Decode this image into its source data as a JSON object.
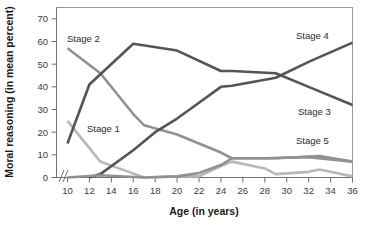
{
  "chart_data": {
    "type": "line",
    "title": "",
    "xlabel": "Age (in years)",
    "ylabel": "Moral reasoning (in mean percent)",
    "xlim": [
      9,
      36
    ],
    "ylim": [
      0,
      75
    ],
    "xticks": [
      10,
      12,
      14,
      16,
      18,
      20,
      22,
      24,
      26,
      28,
      30,
      32,
      34,
      36
    ],
    "yticks": [
      0,
      10,
      20,
      30,
      40,
      50,
      60,
      70
    ],
    "grid": false,
    "legend": "inline-labels",
    "axis_break": "//",
    "x": [
      10,
      12,
      13,
      14,
      16,
      17,
      18,
      20,
      22,
      24,
      25,
      26,
      28,
      29,
      30,
      32,
      33,
      34,
      36
    ],
    "series": [
      {
        "name": "Stage 1",
        "label": "Stage 1",
        "color": "#b8b8b8",
        "x": [
          10,
          13,
          17,
          20,
          22,
          24,
          25,
          28,
          29,
          32,
          33,
          36
        ],
        "values": [
          25,
          7,
          0,
          0.5,
          0.5,
          5,
          7,
          4,
          1.5,
          2.5,
          3.5,
          0.5
        ]
      },
      {
        "name": "Stage 2",
        "label": "Stage 2",
        "color": "#919191",
        "x": [
          10,
          13,
          16,
          17,
          20,
          22,
          24,
          25,
          29,
          33,
          36
        ],
        "values": [
          57,
          46,
          28,
          23,
          19,
          15,
          11,
          8.5,
          8.5,
          9.5,
          7
        ]
      },
      {
        "name": "Stage 3",
        "label": "Stage 3",
        "color": "#555555",
        "x": [
          10,
          12,
          16,
          20,
          24,
          25,
          29,
          32,
          36
        ],
        "values": [
          15,
          41,
          59,
          56,
          47,
          47,
          46,
          40,
          32
        ]
      },
      {
        "name": "Stage 4",
        "label": "Stage 4",
        "color": "#555555",
        "x": [
          12,
          13,
          16,
          18,
          20,
          22,
          24,
          25,
          29,
          32,
          36
        ],
        "values": [
          0,
          1.5,
          12,
          20,
          26,
          33,
          40,
          40.5,
          44,
          51,
          59.5
        ]
      },
      {
        "name": "Stage 5",
        "label": "Stage 5",
        "color": "#919191",
        "x": [
          10,
          13,
          17,
          20,
          22,
          24,
          25,
          28,
          32,
          36
        ],
        "values": [
          0,
          1,
          0,
          0.5,
          2,
          5.5,
          8.5,
          8.5,
          9,
          7
        ]
      }
    ],
    "series_labels": [
      {
        "name": "Stage 1",
        "label": "Stage 1",
        "x_px": 87,
        "y_px": 132
      },
      {
        "name": "Stage 2",
        "label": "Stage 2",
        "x_px": 67,
        "y_px": 42
      },
      {
        "name": "Stage 3",
        "label": "Stage 3",
        "x_px": 298,
        "y_px": 115
      },
      {
        "name": "Stage 4",
        "label": "Stage 4",
        "x_px": 296,
        "y_px": 39
      },
      {
        "name": "Stage 5",
        "label": "Stage 5",
        "x_px": 296,
        "y_px": 144
      }
    ],
    "colors": {
      "stage1": "#b8b8b8",
      "stage2": "#919191",
      "stage3": "#555555",
      "stage4": "#555555",
      "stage5": "#919191",
      "frame": "#9a9a9a",
      "axis": "#6f6f6f",
      "text": "#1a1a1a"
    }
  }
}
